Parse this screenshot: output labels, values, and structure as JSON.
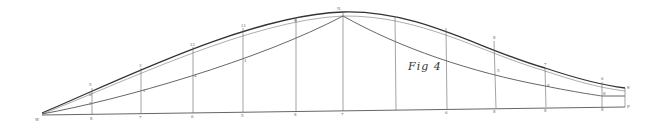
{
  "figure": {
    "caption": "Fig 4",
    "origin_label": "W",
    "colors": {
      "ink": "#555555",
      "ink_bold": "#333333",
      "ink_light": "#8a8a8a",
      "background": "#ffffff"
    }
  },
  "geometry": {
    "stations_x": [
      92,
      138,
      191,
      244,
      296,
      343,
      395,
      447,
      494,
      545,
      602,
      625
    ],
    "baseline": {
      "x1": 42,
      "y1": 115,
      "x2": 625,
      "y2": 107
    },
    "outer_curve": "M42,113 C120,80 250,15 343,12 C420,10 480,50 545,68 C575,78 600,85 625,88",
    "inner_curve": "M42,114 C120,84 250,20 343,16 C420,15 480,52 545,71 C575,81 600,88 625,91",
    "lower_curve": "M42,114 C120,100 260,60 343,16 C400,48 470,72 545,86 C575,92 595,95 602,96 L625,96",
    "apex_label": "N",
    "station_labels_bottom": [
      "8",
      "7",
      "6",
      "5",
      "8",
      "7",
      "",
      "6",
      "8",
      "8",
      "8",
      "P"
    ],
    "station_labels_top": [
      "5",
      "3",
      "12",
      "11",
      "9",
      "",
      "",
      "8",
      "7",
      "6",
      "",
      "9"
    ],
    "station_labels_mid": [
      "2",
      "1",
      "4",
      "1",
      "",
      "",
      "",
      "",
      "5",
      "8",
      "8",
      ""
    ]
  }
}
